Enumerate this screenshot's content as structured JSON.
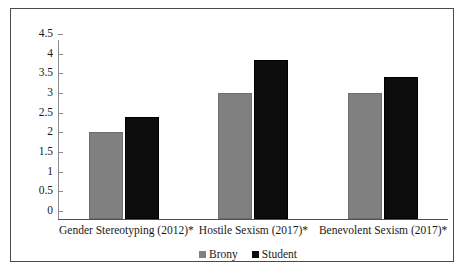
{
  "chart_data": {
    "type": "bar",
    "title": "",
    "subtitle": "",
    "xlabel": "",
    "ylabel": "",
    "ylim": [
      0,
      4.5
    ],
    "ytick_step": 0.5,
    "grid": false,
    "legend_position": "bottom-center",
    "categories": [
      "Gender Stereotyping (2012)*",
      "Hostile Sexism (2017)*",
      "Benevolent Sexism (2017)*"
    ],
    "ytick_labels": [
      "4.5",
      "4",
      "3.5",
      "3",
      "2.5",
      "2",
      "1.5",
      "1",
      "0.5",
      "0"
    ],
    "ytick_values": [
      4.5,
      4,
      3.5,
      3,
      2.5,
      2,
      1.5,
      1,
      0.5,
      0
    ],
    "series": [
      {
        "name": "Brony",
        "color": "#808080",
        "values": [
          2.2,
          3.2,
          3.2
        ]
      },
      {
        "name": "Student",
        "color": "#0d0d0d",
        "values": [
          2.6,
          4.05,
          3.6
        ]
      }
    ],
    "legend": [
      {
        "label": "Brony",
        "color": "#808080"
      },
      {
        "label": "Student",
        "color": "#0d0d0d"
      }
    ]
  }
}
